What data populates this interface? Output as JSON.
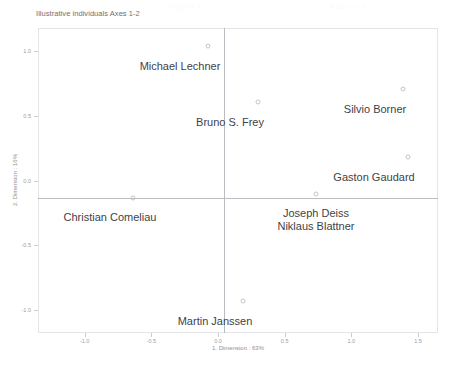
{
  "ghost_header": {
    "left": "Figure 4",
    "right": "Axes 1-2"
  },
  "chart_data": {
    "type": "scatter",
    "title": "Illustrative individuals Axes 1-2",
    "xlabel": "1. Dimension : 63%",
    "ylabel": "2. Dimension : 16%",
    "xlim": [
      -1.35,
      1.65
    ],
    "ylim": [
      -1.18,
      1.18
    ],
    "xticks": [
      -1.0,
      -0.5,
      0.0,
      0.5,
      1.0,
      1.5
    ],
    "xticklabels": [
      "-1.0",
      "-0.5",
      "0.0",
      "0.5",
      "1.0",
      "1.5"
    ],
    "yticks": [
      1.0,
      0.5,
      0.0,
      -0.5,
      -1.0
    ],
    "yticklabels": [
      "1.0",
      "0.5",
      "0.0",
      "-0.5",
      "-1.0"
    ],
    "grid": false,
    "legend": "none",
    "zero_axes": true,
    "marker": "open-circle",
    "points": [
      {
        "label": "Michael Lechner",
        "x": -0.12,
        "y": 1.03,
        "px": 208,
        "py": 46,
        "label_px": 180,
        "label_py": 60,
        "label_anchor": "middle"
      },
      {
        "label": "Silvio Borner",
        "x": 1.34,
        "y": 0.7,
        "px": 403,
        "py": 89,
        "label_px": 375,
        "label_py": 103,
        "label_anchor": "middle"
      },
      {
        "label": "Bruno S. Frey",
        "x": 0.25,
        "y": 0.58,
        "px": 258,
        "py": 102,
        "label_px": 230,
        "label_py": 116,
        "label_anchor": "middle"
      },
      {
        "label": "Gaston Gaudard",
        "x": 1.38,
        "y": 0.24,
        "px": 408,
        "py": 157,
        "label_px": 374,
        "label_py": 171,
        "label_anchor": "middle"
      },
      {
        "label": "Joseph Deiss",
        "x": 0.69,
        "y": 0.03,
        "px": 316,
        "py": 194,
        "label_px": 316,
        "label_py": 207,
        "label_anchor": "middle"
      },
      {
        "label": "Niklaus Blattner",
        "x": 0.69,
        "y": 0.03,
        "px": 316,
        "py": 194,
        "label_px": 316,
        "label_py": 220,
        "label_anchor": "middle",
        "shares_marker": true
      },
      {
        "label": "Christian Comeliau",
        "x": -0.68,
        "y": 0.0,
        "px": 133,
        "py": 198,
        "label_px": 110,
        "label_py": 211,
        "label_anchor": "middle"
      },
      {
        "label": "Martin Janssen",
        "x": 0.14,
        "y": -0.8,
        "px": 243,
        "py": 301,
        "label_px": 215,
        "label_py": 315,
        "label_anchor": "middle"
      }
    ]
  }
}
